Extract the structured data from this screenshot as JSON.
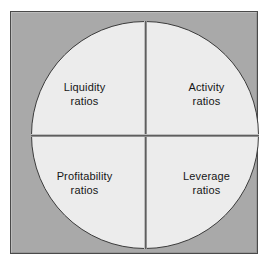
{
  "figure": {
    "kind": "quadrant-circle-diagram",
    "background_color": "#ffffff",
    "panel_color": "#a9a9a9",
    "panel_border_color": "#4a4a4a",
    "circle_fill_color": "#ececec",
    "circle_border_color": "#3c3c3c",
    "divider_color": "#5e5e5e",
    "text_color": "#161616"
  },
  "chart_data": {
    "type": "pie",
    "title": "",
    "categories": [
      "Liquidity ratios",
      "Activity ratios",
      "Profitability ratios",
      "Leverage ratios"
    ],
    "values": [
      25,
      25,
      25,
      25
    ],
    "legend": "none",
    "grid": false
  },
  "quadrants": {
    "top_left": {
      "line1": "Liquidity",
      "line2": "ratios",
      "text": "Liquidity\nratios"
    },
    "top_right": {
      "line1": "Activity",
      "line2": "ratios",
      "text": "Activity\nratios"
    },
    "bottom_left": {
      "line1": "Profitability",
      "line2": "ratios",
      "text": "Profitability\nratios"
    },
    "bottom_right": {
      "line1": "Leverage",
      "line2": "ratios",
      "text": "Leverage\nratios"
    }
  }
}
